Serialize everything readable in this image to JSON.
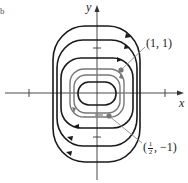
{
  "figure": {
    "type": "phase-portrait",
    "panel_label": "b",
    "axes": {
      "x_label": "x",
      "y_label": "y",
      "origin_px": [
        97,
        93
      ]
    },
    "points": [
      {
        "label": "(1, 1)",
        "x": 1,
        "y": 1
      },
      {
        "label_prefix": "(",
        "label_frac_num": "1",
        "label_frac_den": "2",
        "label_suffix": ", −1)",
        "x": 0.5,
        "y": -1
      }
    ],
    "colors": {
      "trajectory_dark": "#1a1a1a",
      "trajectory_gray": "#777777",
      "axis": "#333333",
      "pointer": "#888888",
      "point": "#777777"
    }
  }
}
